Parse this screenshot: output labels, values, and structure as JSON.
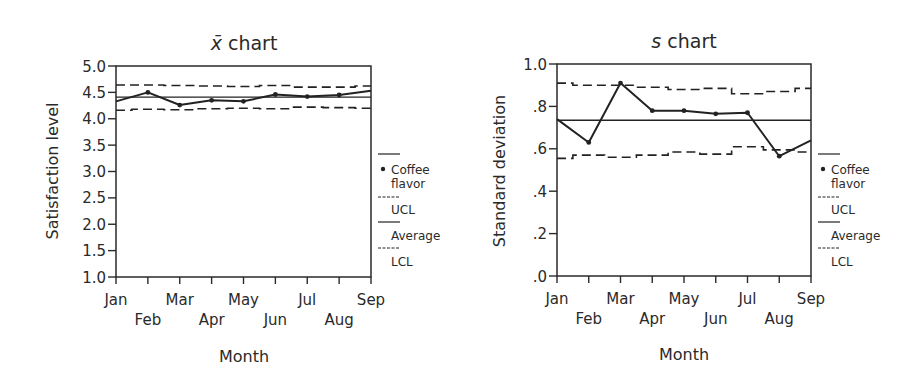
{
  "chart_data": [
    {
      "type": "line",
      "title": "x̄ chart",
      "title_symbol": "x̄",
      "title_suffix": "chart",
      "xlabel": "Month",
      "ylabel": "Satisfaction level",
      "ylim": [
        1.0,
        5.0
      ],
      "yticks": [
        "1.0",
        "1.5",
        "2.0",
        "2.5",
        "3.0",
        "3.5",
        "4.0",
        "4.5",
        "5.0"
      ],
      "categories": [
        "Jan",
        "Feb",
        "Mar",
        "Apr",
        "May",
        "Jun",
        "Jul",
        "Aug",
        "Sep"
      ],
      "series": [
        {
          "name": "Coffee flavor",
          "style": "solid-markers",
          "values": [
            4.33,
            4.5,
            4.26,
            4.35,
            4.33,
            4.46,
            4.42,
            4.45,
            4.53
          ]
        },
        {
          "name": "UCL",
          "style": "dashed-step",
          "values": [
            4.64,
            4.64,
            4.63,
            4.62,
            4.61,
            4.63,
            4.6,
            4.6,
            4.62
          ]
        },
        {
          "name": "Average",
          "style": "solid",
          "values": [
            4.41,
            4.41,
            4.41,
            4.41,
            4.41,
            4.41,
            4.41,
            4.41,
            4.41
          ]
        },
        {
          "name": "LCL",
          "style": "dashed-step",
          "values": [
            4.16,
            4.18,
            4.17,
            4.19,
            4.2,
            4.19,
            4.22,
            4.21,
            4.2
          ]
        }
      ],
      "legend": [
        "Coffee flavor",
        "UCL",
        "Average",
        "LCL"
      ],
      "legend_position": "right"
    },
    {
      "type": "line",
      "title": "s chart",
      "title_symbol": "s",
      "title_suffix": "chart",
      "xlabel": "Month",
      "ylabel": "Standard deviation",
      "ylim": [
        0.0,
        1.0
      ],
      "yticks": [
        ".0",
        ".2",
        ".4",
        ".6",
        ".8",
        "1.0"
      ],
      "categories": [
        "Jan",
        "Feb",
        "Mar",
        "Apr",
        "May",
        "Jun",
        "Jul",
        "Aug",
        "Sep"
      ],
      "series": [
        {
          "name": "Coffee flavor",
          "style": "solid-markers",
          "values": [
            0.74,
            0.63,
            0.91,
            0.78,
            0.78,
            0.765,
            0.77,
            0.565,
            0.64
          ]
        },
        {
          "name": "UCL",
          "style": "dashed-step",
          "values": [
            0.91,
            0.9,
            0.9,
            0.89,
            0.88,
            0.885,
            0.86,
            0.87,
            0.885
          ]
        },
        {
          "name": "Average",
          "style": "solid",
          "values": [
            0.735,
            0.735,
            0.735,
            0.735,
            0.735,
            0.735,
            0.735,
            0.735,
            0.735
          ]
        },
        {
          "name": "LCL",
          "style": "dashed-step",
          "values": [
            0.555,
            0.57,
            0.56,
            0.57,
            0.585,
            0.575,
            0.61,
            0.595,
            0.585
          ]
        }
      ],
      "legend": [
        "Coffee flavor",
        "UCL",
        "Average",
        "LCL"
      ],
      "legend_position": "right"
    }
  ],
  "legend_labels": {
    "coffee_line1": "Coffee",
    "coffee_line2": "flavor",
    "ucl": "UCL",
    "average": "Average",
    "lcl": "LCL"
  }
}
